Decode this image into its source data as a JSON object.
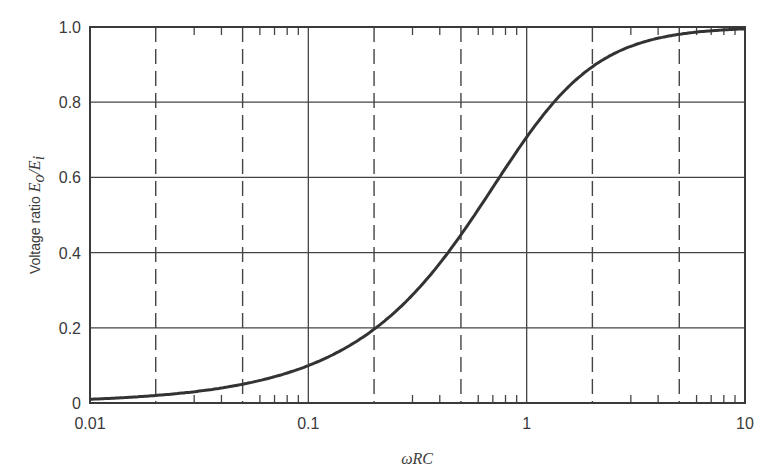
{
  "chart_data": {
    "type": "line",
    "title": "",
    "xlabel": "ωRC",
    "ylabel": "Voltage ratio E_o/E_i",
    "ylabel_prefix": "Voltage ratio ",
    "ylabel_math": "E",
    "ylabel_sub_o": "o",
    "ylabel_slash": "/E",
    "ylabel_sub_i": "i",
    "x_scale": "log",
    "xlim": [
      0.01,
      10
    ],
    "ylim": [
      0,
      1.0
    ],
    "x_ticks": [
      0.01,
      0.1,
      1,
      10
    ],
    "x_tick_labels": [
      "0.01",
      "0.1",
      "1",
      "10"
    ],
    "y_ticks": [
      0,
      0.2,
      0.4,
      0.6,
      0.8,
      1.0
    ],
    "y_tick_labels": [
      "0",
      "0.2",
      "0.4",
      "0.6",
      "0.8",
      "1.0"
    ],
    "grid": {
      "horizontal_solid": [
        0.2,
        0.4,
        0.6,
        0.8
      ],
      "vertical_solid": [
        0.1,
        1
      ],
      "vertical_dashed": [
        0.02,
        0.05,
        0.2,
        0.5,
        2,
        5
      ]
    },
    "legend": null,
    "series": [
      {
        "name": "E_o/E_i",
        "formula": "x / sqrt(1 + x^2)",
        "x": [
          0.01,
          0.02,
          0.03,
          0.05,
          0.07,
          0.1,
          0.15,
          0.2,
          0.3,
          0.4,
          0.5,
          0.7,
          1,
          1.5,
          2,
          3,
          4,
          5,
          7,
          10
        ],
        "values": [
          0.01,
          0.02,
          0.03,
          0.05,
          0.07,
          0.1,
          0.148,
          0.196,
          0.287,
          0.371,
          0.447,
          0.573,
          0.707,
          0.832,
          0.894,
          0.949,
          0.97,
          0.981,
          0.99,
          0.995
        ]
      }
    ]
  }
}
